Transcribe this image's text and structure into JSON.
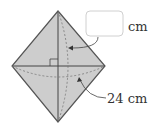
{
  "figure": {
    "shape": "rhombus-folded",
    "fill_color": "#cccccc",
    "stroke_color": "#555555",
    "answer_box": {
      "value": "",
      "unit": "cm"
    },
    "diagonal_label": "24 cm",
    "right_angle_marker": true
  }
}
